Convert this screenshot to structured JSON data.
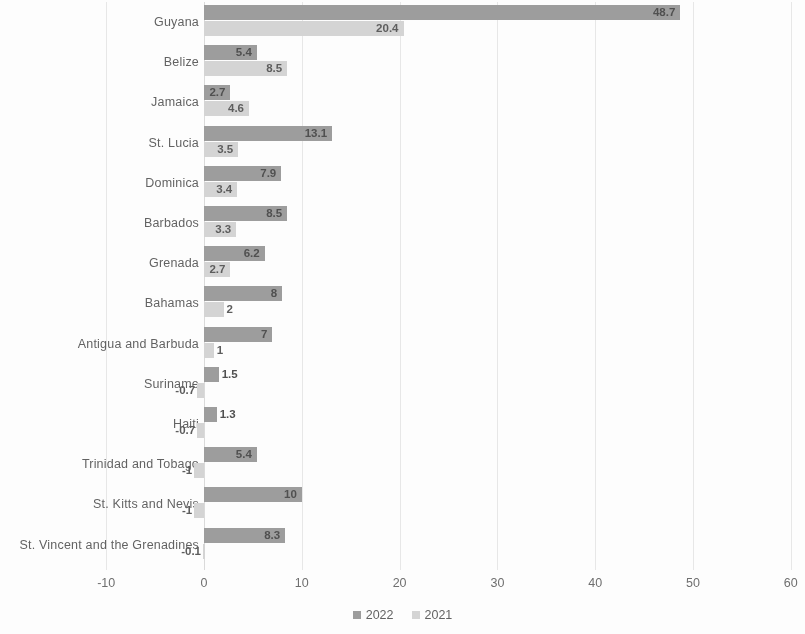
{
  "chart_data": {
    "type": "bar",
    "orientation": "horizontal",
    "title": "",
    "subtitle": "",
    "xlabel": "",
    "ylabel": "",
    "xlim": [
      -10,
      60
    ],
    "xticks": [
      "-10",
      "0",
      "10",
      "20",
      "30",
      "40",
      "50",
      "60"
    ],
    "xtick_values": [
      -10,
      0,
      10,
      20,
      30,
      40,
      50,
      60
    ],
    "grid": true,
    "grid_axis": "x",
    "legend_position": "bottom",
    "categories": [
      "Guyana",
      "Belize",
      "Jamaica",
      "St. Lucia",
      "Dominica",
      "Barbados",
      "Grenada",
      "Bahamas",
      "Antigua and Barbuda",
      "Suriname",
      "Haiti",
      "Trinidad and Tobago",
      "St. Kitts and Nevis",
      "St. Vincent and the Grenadines"
    ],
    "series": [
      {
        "name": "2022",
        "color": "#9a9a9a",
        "values": [
          48.7,
          5.4,
          2.7,
          13.1,
          7.9,
          8.5,
          6.2,
          8,
          7,
          1.5,
          1.3,
          5.4,
          10,
          8.3
        ],
        "labels": [
          "48.7",
          "5.4",
          "2.7",
          "13.1",
          "7.9",
          "8.5",
          "6.2",
          "8",
          "7",
          "1.5",
          "1.3",
          "5.4",
          "10",
          "8.3"
        ]
      },
      {
        "name": "2021",
        "color": "#d4d4d4",
        "values": [
          20.4,
          8.5,
          4.6,
          3.5,
          3.4,
          3.3,
          2.7,
          2,
          1,
          -0.7,
          -0.7,
          -1,
          -1,
          -0.1
        ],
        "labels": [
          "20.4",
          "8.5",
          "4.6",
          "3.5",
          "3.4",
          "3.3",
          "2.7",
          "2",
          "1",
          "-0.7",
          "-0.7",
          "-1",
          "-1",
          "-0.1"
        ]
      }
    ]
  },
  "legend": {
    "items": [
      {
        "label": "2022",
        "color": "#9a9a9a"
      },
      {
        "label": "2021",
        "color": "#d4d4d4"
      }
    ]
  }
}
